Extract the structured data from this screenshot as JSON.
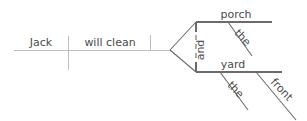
{
  "diagram": {
    "type": "reed-kellogg-sentence-diagram",
    "sentence": "Jack will clean the porch and the front yard",
    "canvas": {
      "width": 307,
      "height": 121,
      "background": "#ffffff"
    },
    "style": {
      "line_color": "#6b6b6b",
      "faint_line_color": "#bdbdbd",
      "text_color": "#4a4a4a",
      "font_size_px": 11,
      "stroke_width": 1.1
    },
    "words": {
      "subject": "Jack",
      "verb": "will clean",
      "conjunction": "and",
      "object_one": "porch",
      "object_one_article": "the",
      "object_two": "yard",
      "object_two_article": "the",
      "object_two_modifier": "front"
    },
    "labels": [
      {
        "id": "subject",
        "text": "Jack",
        "x": 41,
        "y": 46,
        "rotation": 0,
        "anchor": "middle"
      },
      {
        "id": "verb",
        "text": "will clean",
        "x": 110,
        "y": 46,
        "rotation": 0,
        "anchor": "middle"
      },
      {
        "id": "conjunction",
        "text": "and",
        "x": 204,
        "y": 50,
        "rotation": -90,
        "anchor": "middle"
      },
      {
        "id": "object-one",
        "text": "porch",
        "x": 236,
        "y": 18,
        "rotation": 0,
        "anchor": "middle"
      },
      {
        "id": "object-one-article",
        "text": "the",
        "x": 240,
        "y": 40,
        "rotation": 47,
        "anchor": "middle"
      },
      {
        "id": "object-two",
        "text": "yard",
        "x": 233,
        "y": 68,
        "rotation": 0,
        "anchor": "middle"
      },
      {
        "id": "object-two-article",
        "text": "the",
        "x": 233,
        "y": 92,
        "rotation": 47,
        "anchor": "middle"
      },
      {
        "id": "object-two-modifier",
        "text": "front",
        "x": 279,
        "y": 92,
        "rotation": 47,
        "anchor": "middle"
      }
    ],
    "lines": {
      "main_baseline": {
        "x1": 14,
        "y1": 50,
        "x2": 170,
        "y2": 50,
        "kind": "faint"
      },
      "subject_verb_divider": {
        "x1": 68,
        "y1": 36,
        "x2": 68,
        "y2": 70,
        "kind": "faint"
      },
      "object_divider": {
        "x1": 150,
        "y1": 35,
        "x2": 150,
        "y2": 50,
        "kind": "faint"
      },
      "fork_upper_arm": {
        "x1": 170,
        "y1": 50,
        "x2": 196,
        "y2": 22,
        "kind": "solid"
      },
      "fork_lower_arm": {
        "x1": 170,
        "y1": 50,
        "x2": 196,
        "y2": 72,
        "kind": "solid"
      },
      "porch_baseline": {
        "x1": 196,
        "y1": 22,
        "x2": 272,
        "y2": 22,
        "kind": "solid"
      },
      "yard_baseline": {
        "x1": 196,
        "y1": 72,
        "x2": 282,
        "y2": 72,
        "kind": "solid"
      },
      "porch_stub": {
        "x1": 196,
        "y1": 22,
        "x2": 196,
        "y2": 32,
        "kind": "solid"
      },
      "yard_stub": {
        "x1": 196,
        "y1": 62,
        "x2": 196,
        "y2": 72,
        "kind": "solid"
      },
      "conjunction_dashed": {
        "x1": 196,
        "y1": 26,
        "x2": 196,
        "y2": 68,
        "kind": "dashed"
      },
      "porch_article_slant": {
        "x1": 228,
        "y1": 22,
        "x2": 252,
        "y2": 56,
        "kind": "solid"
      },
      "yard_article_slant": {
        "x1": 220,
        "y1": 72,
        "x2": 248,
        "y2": 110,
        "kind": "solid"
      },
      "yard_modifier_slant": {
        "x1": 256,
        "y1": 72,
        "x2": 296,
        "y2": 120,
        "kind": "solid"
      }
    }
  }
}
